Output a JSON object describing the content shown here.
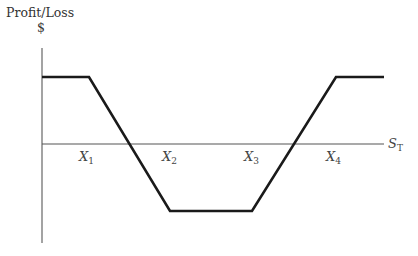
{
  "chart_data": {
    "type": "line",
    "title": "",
    "ylabel": "Profit/Loss",
    "yunit": "$",
    "xlabel": "S_T",
    "xlabel_main": "S",
    "xlabel_sub": "T",
    "ticks": [
      {
        "main": "X",
        "sub": "1",
        "x": 89
      },
      {
        "main": "X",
        "sub": "2",
        "x": 170
      },
      {
        "main": "X",
        "sub": "3",
        "x": 252
      },
      {
        "main": "X",
        "sub": "4",
        "x": 336
      }
    ],
    "payoff_points_px": [
      [
        42,
        77
      ],
      [
        89,
        77
      ],
      [
        170,
        211
      ],
      [
        252,
        211
      ],
      [
        336,
        77
      ],
      [
        384,
        77
      ]
    ],
    "series": [
      {
        "name": "Profit/Loss",
        "x": [
          "0",
          "X1",
          "X2",
          "X3",
          "X4",
          "beyond X4"
        ],
        "values": [
          1,
          1,
          -1,
          -1,
          1,
          1
        ],
        "description": "Short condor-like payoff: positive flat below X1, falls to negative flat between X2 and X3, rises back to positive flat above X4"
      }
    ],
    "zero_crossings_px": [
      132,
      294
    ],
    "grid": false,
    "legend": false,
    "colors": {
      "payoff_line": "#1a1a1a",
      "axes": "#555555"
    }
  }
}
